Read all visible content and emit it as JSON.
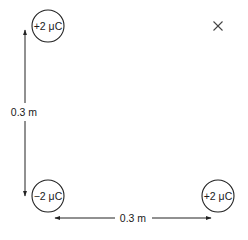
{
  "diagram": {
    "charges": [
      {
        "id": "top-left",
        "label": "+2 μC",
        "sign": "positive",
        "cx": 48,
        "cy": 26,
        "r": 16
      },
      {
        "id": "bottom-left",
        "label": "−2 μC",
        "sign": "negative",
        "cx": 48,
        "cy": 196,
        "r": 16
      },
      {
        "id": "bottom-right",
        "label": "+2 μC",
        "sign": "positive",
        "cx": 218,
        "cy": 196,
        "r": 16
      }
    ],
    "point": {
      "id": "top-right",
      "symbol": "×",
      "cx": 218,
      "cy": 26
    },
    "dimensions": {
      "vertical": {
        "label": "0.3 m",
        "x": 25,
        "y1": 30,
        "y2": 196
      },
      "horizontal": {
        "label": "0.3 m",
        "y": 218,
        "x1": 55,
        "x2": 210
      }
    },
    "colors": {
      "stroke": "#222222",
      "text": "#1a1a1a",
      "background": "#ffffff"
    }
  }
}
